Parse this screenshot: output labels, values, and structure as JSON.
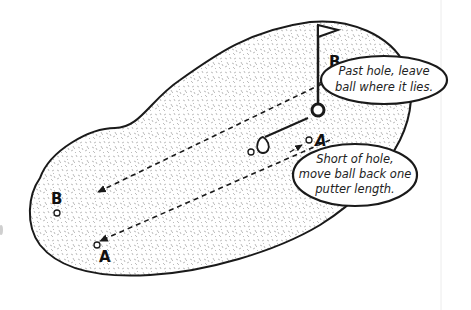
{
  "diagram": {
    "colors": {
      "outline": "#1a1a1a",
      "fill": "#ffffff",
      "speckle": "#9a9a9a",
      "text": "#222222"
    },
    "labels": {
      "point_b_near_hole": "B",
      "point_a_near_hole": "A",
      "point_b_far": "B",
      "point_a_far": "A"
    },
    "callouts": {
      "past_hole": {
        "line1": "Past hole, leave",
        "line2": "ball where it lies."
      },
      "short_of_hole": {
        "line1": "Short of hole,",
        "line2": "move ball back one",
        "line3": "putter length."
      }
    },
    "icons": [
      "flag-icon",
      "hole-icon",
      "putter-icon",
      "ball-icon"
    ]
  }
}
